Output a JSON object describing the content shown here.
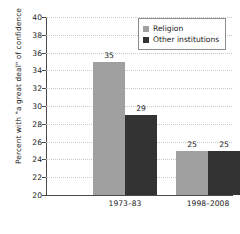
{
  "chart_data": {
    "type": "bar",
    "title": "",
    "xlabel": "",
    "ylabel": "Percent with \"a great deal\" of confidence",
    "categories": [
      "1973–83",
      "1998–2008"
    ],
    "series": [
      {
        "name": "Religion",
        "values": [
          35,
          29
        ],
        "color": "#a0a0a0"
      },
      {
        "name": "Other institutions",
        "values": [
          29,
          25
        ],
        "color": "#333333"
      }
    ],
    "ylim": [
      20,
      40
    ],
    "ytick_step": 2,
    "yticks": [
      20,
      22,
      24,
      26,
      28,
      30,
      32,
      34,
      36,
      38,
      40
    ],
    "ytick_labels": [
      "20",
      "22",
      "24",
      "26",
      "28",
      "30",
      "32",
      "34",
      "36",
      "38",
      "40"
    ],
    "bars": [
      {
        "category": "1973–83",
        "series": "Religion",
        "value": 35,
        "label": "35"
      },
      {
        "category": "1973–83",
        "series": "Other institutions",
        "value": 29,
        "label": "29"
      },
      {
        "category": "1998–2008",
        "series": "Religion",
        "value": 25,
        "label": "25"
      },
      {
        "category": "1998–2008",
        "series": "Other institutions",
        "value": 25,
        "label": "25"
      }
    ],
    "grid": true,
    "grid_style": "dotted-horizontal",
    "legend_position": "top-right",
    "legend": [
      {
        "label": "Religion",
        "color": "#a0a0a0"
      },
      {
        "label": "Other institutions",
        "color": "#333333"
      }
    ]
  }
}
